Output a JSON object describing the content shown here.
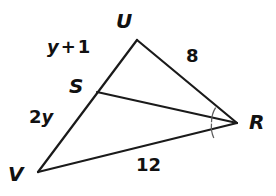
{
  "figure": {
    "background_color": "#ffffff",
    "stroke_color": "#1a1a1a",
    "arc_color": "#5d5d5d",
    "width": 276,
    "height": 196
  },
  "vertices": [
    {
      "id": "U",
      "label": "U",
      "x": 137,
      "y": 40
    },
    {
      "id": "V",
      "label": "V",
      "x": 38,
      "y": 172
    },
    {
      "id": "R",
      "label": "R",
      "x": 237,
      "y": 123
    },
    {
      "id": "S",
      "label": "S",
      "x": 97,
      "y": 92
    }
  ],
  "edges": [
    {
      "id": "UV",
      "from": "U",
      "to": "V",
      "path": "M 137 40 L 38 172"
    },
    {
      "id": "UR",
      "from": "U",
      "to": "R",
      "path": "M 137 40 L 237 123"
    },
    {
      "id": "VR",
      "from": "V",
      "to": "R",
      "path": "M 38 172 L 237 123"
    },
    {
      "id": "SR",
      "from": "S",
      "to": "R",
      "path": "M 97 92 L 237 123"
    }
  ],
  "labels": {
    "side_ur": "8",
    "side_vr": "12",
    "segment_su": {
      "term": "y",
      "operator": "+",
      "constant": "1"
    },
    "segment_sv": {
      "coefficient": "2",
      "variable": "y"
    }
  },
  "angle_marks": [
    {
      "id": "angle-URS",
      "at_vertex": "R",
      "tick_count": 1,
      "arc_path": "M 215.6 107.6 A 27 27 0 0 0 211.5 122.2"
    },
    {
      "id": "angle-SRV",
      "at_vertex": "R",
      "tick_count": 1,
      "arc_path": "M 211.5 123.6 A 27 27 0 0 0 213.8 137.9"
    }
  ]
}
